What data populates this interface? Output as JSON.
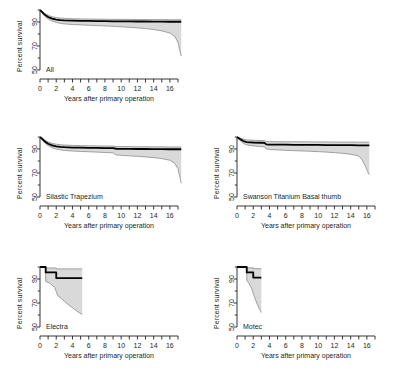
{
  "figure": {
    "background": "#ffffff",
    "axis_color": "#231f20",
    "curve_color": "#000000",
    "band_fill": "#d9d9d9",
    "band_edge": "#808080"
  },
  "axes": {
    "ylabel": "Percent survival",
    "xlabel": "Years after primary operation",
    "yticks": [
      50,
      70,
      90
    ],
    "ytick_labels": [
      "50",
      "70",
      "90"
    ],
    "ylim": [
      50,
      100
    ],
    "xtick_labels": [
      "0",
      "2",
      "4",
      "6",
      "8",
      "10",
      "12",
      "14",
      "16"
    ],
    "xtick_values": [
      0,
      2,
      4,
      6,
      8,
      10,
      12,
      14,
      16
    ],
    "xlim": [
      0,
      17
    ],
    "xminor_step": 1
  },
  "chart_data": {
    "type": "line",
    "title": "",
    "xlabel": "Years after primary operation",
    "ylabel": "Percent survival",
    "ylim": [
      50,
      100
    ],
    "xlim": [
      0,
      17
    ],
    "grid": false,
    "legend": "none",
    "plot_style": "kaplan-meier survival with 95% confidence band",
    "panels": [
      {
        "name": "All",
        "label": "All",
        "xmax": 17.4,
        "series": [
          {
            "name": "survival",
            "x": [
              0,
              0.3,
              0.6,
              1.0,
              1.5,
              2.0,
              2.5,
              3.0,
              4.0,
              5.0,
              6.0,
              7.0,
              8.0,
              9.0,
              10.0,
              11.0,
              12.0,
              13.0,
              14.0,
              15.0,
              16.0,
              17.0,
              17.4
            ],
            "values": [
              100,
              98.0,
              96.0,
              94.2,
              92.8,
              92.0,
              91.6,
              91.3,
              91.1,
              91.0,
              90.9,
              90.8,
              90.7,
              90.6,
              90.5,
              90.5,
              90.4,
              90.4,
              90.3,
              90.3,
              90.2,
              90.2,
              90.2
            ]
          },
          {
            "name": "ci_upper",
            "x": [
              0,
              0.3,
              0.6,
              1.0,
              1.5,
              2.0,
              2.5,
              3.0,
              4.0,
              5.0,
              6.0,
              7.0,
              8.0,
              9.0,
              10.0,
              11.0,
              12.0,
              13.0,
              14.0,
              15.0,
              16.0,
              17.0,
              17.4
            ],
            "values": [
              100,
              98.8,
              97.1,
              95.6,
              94.4,
              93.7,
              93.3,
              93.0,
              92.7,
              92.6,
              92.5,
              92.4,
              92.3,
              92.2,
              92.2,
              92.1,
              92.1,
              92.0,
              92.0,
              92.0,
              91.9,
              91.9,
              91.9
            ]
          },
          {
            "name": "ci_lower",
            "x": [
              0,
              0.3,
              0.6,
              1.0,
              1.5,
              2.0,
              2.5,
              3.0,
              4.0,
              5.0,
              6.0,
              7.0,
              8.0,
              9.0,
              10.0,
              11.0,
              12.0,
              13.0,
              14.0,
              15.0,
              16.0,
              16.6,
              17.0,
              17.2,
              17.4
            ],
            "values": [
              100,
              97.0,
              94.8,
              92.6,
              90.8,
              89.6,
              88.9,
              88.4,
              87.9,
              87.6,
              87.3,
              87.0,
              86.7,
              86.4,
              86.0,
              85.6,
              85.1,
              84.5,
              83.7,
              82.6,
              80.8,
              78.0,
              73.0,
              67.0,
              61.5
            ]
          }
        ]
      },
      {
        "name": "Silastic Trapezium",
        "label": "Silastic Trapezium",
        "xmax": 17.4,
        "series": [
          {
            "name": "survival",
            "x": [
              0,
              0.3,
              0.6,
              1.0,
              1.5,
              2.0,
              2.5,
              3.0,
              4.0,
              5.0,
              6.0,
              7.0,
              8.0,
              9.0,
              9.4,
              10.0,
              11.0,
              12.0,
              13.0,
              14.0,
              15.0,
              16.0,
              17.0,
              17.4
            ],
            "values": [
              100,
              98.2,
              96.3,
              94.4,
              93.0,
              92.2,
              91.8,
              91.5,
              91.2,
              91.1,
              91.0,
              90.9,
              90.8,
              90.7,
              90.2,
              90.1,
              90.1,
              90.0,
              90.0,
              89.9,
              89.9,
              89.8,
              89.8,
              89.8
            ]
          },
          {
            "name": "ci_upper",
            "x": [
              0,
              0.3,
              0.6,
              1.0,
              1.5,
              2.0,
              2.5,
              3.0,
              4.0,
              5.0,
              6.0,
              7.0,
              8.0,
              9.0,
              9.4,
              10.0,
              11.0,
              12.0,
              13.0,
              14.0,
              15.0,
              16.0,
              17.0,
              17.4
            ],
            "values": [
              100,
              99.0,
              97.4,
              95.9,
              94.7,
              94.0,
              93.6,
              93.3,
              93.0,
              92.8,
              92.7,
              92.6,
              92.5,
              92.4,
              92.1,
              92.0,
              92.0,
              91.9,
              91.9,
              91.8,
              91.8,
              91.7,
              91.7,
              91.7
            ]
          },
          {
            "name": "ci_lower",
            "x": [
              0,
              0.3,
              0.6,
              1.0,
              1.5,
              2.0,
              2.5,
              3.0,
              4.0,
              5.0,
              6.0,
              7.0,
              8.0,
              9.0,
              9.4,
              10.0,
              11.0,
              12.0,
              13.0,
              14.0,
              15.0,
              16.0,
              16.6,
              17.0,
              17.2,
              17.4
            ],
            "values": [
              100,
              97.2,
              95.0,
              92.8,
              91.1,
              90.0,
              89.3,
              88.8,
              88.3,
              88.0,
              87.7,
              87.4,
              87.1,
              86.8,
              85.0,
              84.7,
              84.3,
              83.9,
              83.4,
              82.8,
              82.0,
              80.6,
              78.0,
              73.5,
              67.5,
              61.5
            ]
          }
        ]
      },
      {
        "name": "Swanson Titanium Basal thumb",
        "label": "Swanson Titanium Basal thumb",
        "xmax": 16.3,
        "series": [
          {
            "name": "survival",
            "x": [
              0,
              0.4,
              0.8,
              1.2,
              2.0,
              3.0,
              3.4,
              3.6,
              4.0,
              5.0,
              6.0,
              7.0,
              8.0,
              9.0,
              10.0,
              11.0,
              12.0,
              13.0,
              14.0,
              15.0,
              16.0,
              16.3
            ],
            "values": [
              100,
              98.2,
              96.6,
              95.8,
              95.4,
              95.2,
              95.1,
              93.8,
              93.7,
              93.6,
              93.6,
              93.5,
              93.5,
              93.4,
              93.4,
              93.3,
              93.3,
              93.2,
              93.2,
              93.1,
              93.1,
              93.1
            ]
          },
          {
            "name": "ci_upper",
            "x": [
              0,
              0.4,
              0.8,
              1.2,
              2.0,
              3.0,
              3.4,
              3.6,
              4.0,
              5.0,
              6.0,
              7.0,
              8.0,
              9.0,
              10.0,
              11.0,
              12.0,
              13.0,
              14.0,
              15.0,
              16.0,
              16.3
            ],
            "values": [
              100,
              99.2,
              98.2,
              97.6,
              97.3,
              97.1,
              97.0,
              96.3,
              96.2,
              96.1,
              96.1,
              96.0,
              96.0,
              95.9,
              95.9,
              95.9,
              95.8,
              95.8,
              95.8,
              95.7,
              95.7,
              95.7
            ]
          },
          {
            "name": "ci_lower",
            "x": [
              0,
              0.4,
              0.8,
              1.2,
              2.0,
              3.0,
              3.4,
              3.6,
              4.0,
              5.0,
              6.0,
              7.0,
              8.0,
              9.0,
              10.0,
              11.0,
              12.0,
              13.0,
              14.0,
              15.0,
              15.4,
              15.8,
              16.1,
              16.3
            ],
            "values": [
              100,
              96.8,
              94.6,
              93.4,
              92.6,
              92.0,
              91.8,
              90.0,
              89.6,
              89.2,
              88.9,
              88.6,
              88.4,
              88.1,
              87.8,
              87.4,
              87.0,
              86.4,
              85.6,
              84.2,
              81.0,
              76.0,
              71.0,
              68.5
            ]
          }
        ]
      },
      {
        "name": "Electra",
        "label": "Electra",
        "xmax": 5.2,
        "series": [
          {
            "name": "survival",
            "x": [
              0,
              0.7,
              0.7,
              2.0,
              2.0,
              5.2
            ],
            "values": [
              100,
              100,
              95.5,
              95.5,
              90.8,
              90.8
            ]
          },
          {
            "name": "ci_upper",
            "x": [
              0,
              0.7,
              0.7,
              2.0,
              2.0,
              5.2
            ],
            "values": [
              100,
              100,
              99.2,
              99.2,
              98.4,
              98.4
            ]
          },
          {
            "name": "ci_lower",
            "x": [
              0,
              0.7,
              0.7,
              1.2,
              1.8,
              2.2,
              2.6,
              3.0,
              3.6,
              4.2,
              4.8,
              5.2
            ],
            "values": [
              100,
              100,
              88.0,
              86.5,
              83.0,
              76.0,
              74.0,
              71.5,
              68.0,
              65.0,
              62.0,
              60.5
            ]
          }
        ]
      },
      {
        "name": "Motec",
        "label": "Motec",
        "xmax": 3.0,
        "series": [
          {
            "name": "survival",
            "x": [
              0,
              1.2,
              1.2,
              2.0,
              2.0,
              3.0
            ],
            "values": [
              100,
              100,
              95.5,
              95.5,
              91.2,
              91.2
            ]
          },
          {
            "name": "ci_upper",
            "x": [
              0,
              1.2,
              1.2,
              2.0,
              2.0,
              3.0
            ],
            "values": [
              100,
              100,
              99.3,
              99.3,
              98.6,
              98.6
            ]
          },
          {
            "name": "ci_lower",
            "x": [
              0,
              1.2,
              1.2,
              1.5,
              1.8,
              2.0,
              2.2,
              2.5,
              2.8,
              3.0
            ],
            "values": [
              100,
              100,
              89.0,
              86.0,
              82.0,
              78.0,
              74.0,
              69.0,
              64.5,
              62.0
            ]
          }
        ]
      }
    ]
  }
}
